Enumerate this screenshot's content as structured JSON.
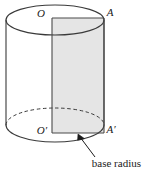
{
  "figure": {
    "name": "cylinder-axial-cross-section",
    "background_color": "#ffffff",
    "stroke_color": "#3a3a3a",
    "shaded_fill_color": "#e5e5e5",
    "shaded_fill_label": "axial cross-section rectangle",
    "labels": {
      "top_left": "O",
      "top_right": "A",
      "bottom_left": "O′",
      "bottom_right": "A′"
    },
    "annotation": {
      "text": "base radius",
      "leader": "arrow pointing up-left to segment O′A′"
    },
    "geometry": {
      "cylinder_left_x": 6,
      "cylinder_right_x": 104,
      "top_ellipse_center_y": 20,
      "top_ellipse_ry": 15,
      "bottom_ellipse_center_y": 125,
      "bottom_ellipse_ry": 17,
      "rect_left_x": 52,
      "rect_right_x": 104,
      "rect_top_y": 18,
      "rect_bottom_y": 133,
      "hidden_arc_style": "dashed"
    }
  }
}
